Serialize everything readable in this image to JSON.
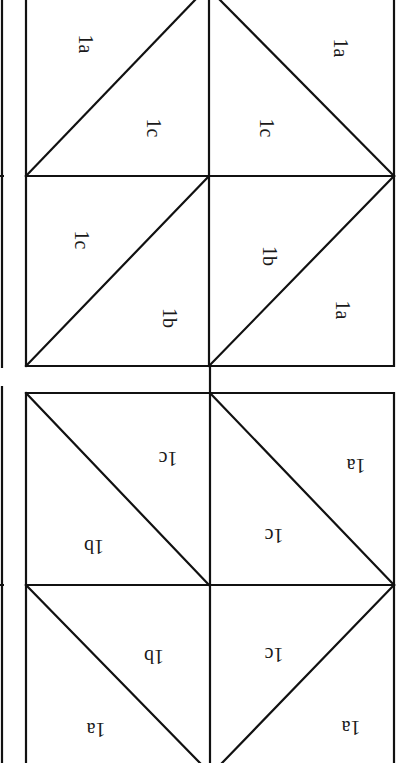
{
  "diagram": {
    "colors": {
      "line": "#111111",
      "background": "#ffffff",
      "text": "#1a1a1a"
    },
    "top_panel": {
      "orientation": "rotated-90",
      "labels": {
        "tl_outer": "1a",
        "tl_inner": "1c",
        "tr_inner": "1c",
        "tr_outer": "1a",
        "bl_upper": "1c",
        "bl_lower": "1b",
        "br_upper": "1b",
        "br_lower": "1a"
      }
    },
    "bottom_panel": {
      "orientation": "rotated-180",
      "labels": {
        "tl_upper": "1c",
        "tl_lower": "1b",
        "tr_upper": "1a",
        "tr_lower": "1c",
        "bl_upper": "1b",
        "bl_lower": "1a",
        "br_upper": "1c",
        "br_lower": "1a"
      }
    }
  }
}
